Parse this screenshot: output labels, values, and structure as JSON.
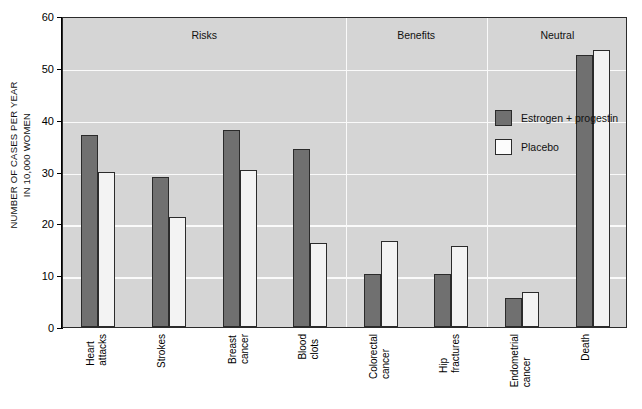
{
  "chart_data": {
    "type": "bar",
    "title": "",
    "xlabel": "",
    "ylabel": "NUMBER OF CASES PER YEAR\nIN 10,000 WOMEN",
    "ylim": [
      0,
      60
    ],
    "ytick_values": [
      0,
      10,
      20,
      30,
      40,
      50,
      60
    ],
    "ytick_labels": [
      "0",
      "10",
      "20",
      "30",
      "40",
      "50",
      "60"
    ],
    "grid": true,
    "legend_position": "upper right",
    "categories": [
      "Heart\nattacks",
      "Strokes",
      "Breast\ncancer",
      "Blood\nclots",
      "Colorectal\ncancer",
      "Hip\nfractures",
      "Endometrial\ncancer",
      "Death"
    ],
    "series": [
      {
        "name": "Estrogen + progestin",
        "color": "#707070",
        "values": [
          37.0,
          29.0,
          38.0,
          34.3,
          10.3,
          10.3,
          5.6,
          52.4
        ]
      },
      {
        "name": "Placebo",
        "color": "#f3f3f3",
        "values": [
          30.0,
          21.2,
          30.2,
          16.2,
          16.5,
          15.6,
          6.7,
          53.4
        ]
      }
    ],
    "sections": [
      {
        "label": "Risks",
        "categories": [
          "Heart attacks",
          "Strokes",
          "Breast cancer",
          "Blood clots"
        ]
      },
      {
        "label": "Benefits",
        "categories": [
          "Colorectal cancer",
          "Hip fractures"
        ]
      },
      {
        "label": "Neutral",
        "categories": [
          "Endometrial cancer",
          "Death"
        ]
      }
    ]
  },
  "colors": {
    "plot_background": "#d5d5d5",
    "gridline": "#fafafa",
    "axis": "#2b2b2b",
    "treatment_bar": "#707070",
    "placebo_bar": "#f3f3f3"
  }
}
